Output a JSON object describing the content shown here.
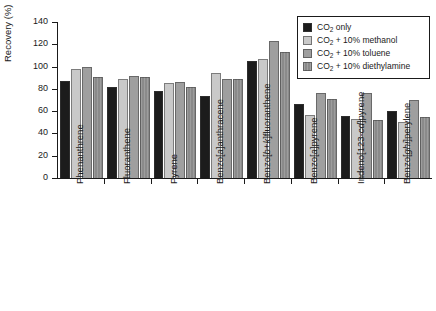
{
  "chart_data": {
    "type": "bar",
    "title": "",
    "xlabel": "",
    "ylabel": "Recovery (%)",
    "ylim": [
      0,
      140
    ],
    "yticks": [
      0,
      20,
      40,
      60,
      80,
      100,
      120,
      140
    ],
    "grid": false,
    "legend_position": "top-right",
    "categories": [
      "Phenanthrene",
      "Fluoranthene",
      "Pyrene",
      "Benzo[a]anthracene",
      "Benzo[b+k]fluoranthene",
      "Benzo[a]pyrene",
      "Indeno[123-cd]pyrene",
      "Benzo[ghi]perylene"
    ],
    "series": [
      {
        "name": "CO2 only",
        "label_prefix": "CO",
        "label_sub": "2",
        "label_suffix": " only",
        "color": "#1c1c1c",
        "values": [
          87,
          82,
          78,
          74,
          105,
          66,
          56,
          60
        ]
      },
      {
        "name": "CO2 + 10% methanol",
        "label_prefix": "CO",
        "label_sub": "2",
        "label_suffix": " + 10% methanol",
        "color": "#c9c9c9",
        "values": [
          98,
          89,
          85,
          94,
          107,
          57,
          53,
          50
        ]
      },
      {
        "name": "CO2 + 10% toluene",
        "label_prefix": "CO",
        "label_sub": "2",
        "label_suffix": " + 10% toluene",
        "color": "#9f9f9f",
        "values": [
          100,
          92,
          86,
          89,
          123,
          76,
          76,
          70
        ]
      },
      {
        "name": "CO2 + 10% diethylamine",
        "label_prefix": "CO",
        "label_sub": "2",
        "label_suffix": " + 10% diethylamine",
        "color": "#8a8a8a",
        "values": [
          91,
          91,
          82,
          89,
          113,
          71,
          52,
          55
        ]
      }
    ]
  },
  "axis": {
    "y_title": "Recovery (%)",
    "y_tick_labels": [
      "140",
      "120",
      "100",
      "80",
      "60",
      "40",
      "20",
      "0"
    ]
  },
  "category_labels_rich": [
    {
      "plain": "Phenanthrene",
      "parts": [
        {
          "t": "Phenanthrene",
          "i": false
        }
      ]
    },
    {
      "plain": "Fluoranthene",
      "parts": [
        {
          "t": "Fluoranthene",
          "i": false
        }
      ]
    },
    {
      "plain": "Pyrene",
      "parts": [
        {
          "t": "Pyrene",
          "i": false
        }
      ]
    },
    {
      "plain": "Benzo[a]anthracene",
      "parts": [
        {
          "t": "Benzo[",
          "i": false
        },
        {
          "t": "a",
          "i": true
        },
        {
          "t": "]anthracene",
          "i": false
        }
      ]
    },
    {
      "plain": "Benzo[b+k]fluoranthene",
      "parts": [
        {
          "t": "Benzo[",
          "i": false
        },
        {
          "t": "b+k",
          "i": true
        },
        {
          "t": "]fluoranthene",
          "i": false
        }
      ]
    },
    {
      "plain": "Benzo[a]pyrene",
      "parts": [
        {
          "t": "Benzo[",
          "i": false
        },
        {
          "t": "a",
          "i": true
        },
        {
          "t": "]pyrene",
          "i": false
        }
      ]
    },
    {
      "plain": "Indeno[123-cd]pyrene",
      "parts": [
        {
          "t": "Indeno[123-",
          "i": false
        },
        {
          "t": "cd",
          "i": true
        },
        {
          "t": "]pyrene",
          "i": false
        }
      ]
    },
    {
      "plain": "Benzo[ghi]perylene",
      "parts": [
        {
          "t": "Benzo[",
          "i": false
        },
        {
          "t": "ghi",
          "i": true
        },
        {
          "t": "]perylene",
          "i": false
        }
      ]
    }
  ]
}
